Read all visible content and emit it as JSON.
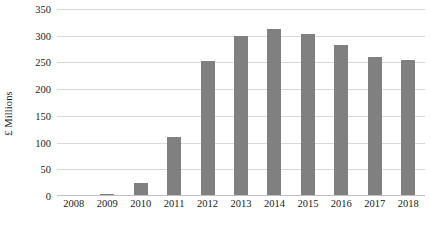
{
  "chart_data": {
    "type": "bar",
    "title": "",
    "subtitle": "",
    "xlabel": "",
    "ylabel": "£ Millions",
    "categories": [
      "2008",
      "2009",
      "2010",
      "2011",
      "2012",
      "2013",
      "2014",
      "2015",
      "2016",
      "2017",
      "2018"
    ],
    "values": [
      1,
      3,
      24,
      110,
      252,
      300,
      313,
      303,
      282,
      261,
      255
    ],
    "series": [
      {
        "name": "£ Millions",
        "values": [
          1,
          3,
          24,
          110,
          252,
          300,
          313,
          303,
          282,
          261,
          255
        ]
      }
    ],
    "ylim": [
      0,
      350
    ],
    "ytick_labels": [
      "0",
      "50",
      "100",
      "150",
      "200",
      "250",
      "300",
      "350"
    ],
    "ytick_values": [
      0,
      50,
      100,
      150,
      200,
      250,
      300,
      350
    ],
    "grid": true,
    "legend": "none",
    "bar_color": "#808080",
    "gridline_color": "#d9d9d9",
    "axis_color": "#bfbfbf",
    "text_color": "#1a1a1a"
  }
}
